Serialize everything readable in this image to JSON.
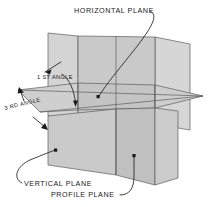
{
  "diagram": {
    "title": "HORIZONTAL PLANE",
    "type": "orthographic-projection-planes",
    "background_color": "#ffffff",
    "plane_fill_light": "#d2d2d2",
    "plane_fill_mid": "#c6c6c6",
    "plane_fill_dark": "#bdbdbd",
    "edge_color": "#5d5d5d",
    "leader_color": "#2a2a2a",
    "text_color": "#1a1a1a",
    "labels": {
      "horizontal_plane": "HORIZONTAL PLANE",
      "first_angle": "1 ST ANGLE",
      "third_angle": "3 RD ANGLE",
      "vertical_plane": "VERTICAL PLANE",
      "profile_plane": "PROFILE PLANE"
    },
    "planes": [
      {
        "name": "horizontal-plane",
        "label": "HORIZONTAL PLANE"
      },
      {
        "name": "vertical-plane",
        "label": "VERTICAL PLANE"
      },
      {
        "name": "profile-plane",
        "label": "PROFILE PLANE"
      }
    ],
    "quadrants": [
      {
        "name": "first-angle",
        "label": "1 ST ANGLE"
      },
      {
        "name": "third-angle",
        "label": "3 RD ANGLE"
      }
    ]
  }
}
